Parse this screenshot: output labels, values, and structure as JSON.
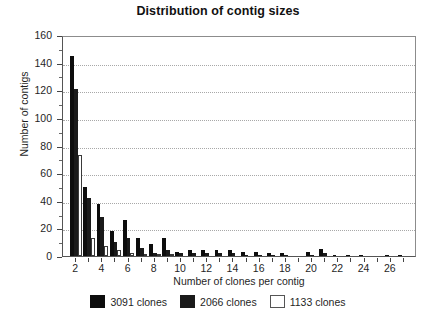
{
  "chart_data": {
    "type": "bar",
    "title": "Distribution of contig sizes",
    "xlabel": "Number of clones per contig",
    "ylabel": "Number of contigs",
    "xlim": [
      1,
      28
    ],
    "ylim": [
      0,
      160
    ],
    "ytick_step": 20,
    "ytick_minor_step": 10,
    "xtick_step": 2,
    "grid": "horizontal-dotted",
    "legend_position": "bottom-center",
    "categories": [
      2,
      3,
      4,
      5,
      6,
      7,
      8,
      9,
      10,
      11,
      12,
      13,
      14,
      15,
      16,
      17,
      18,
      19,
      20,
      21,
      22,
      23,
      24,
      25,
      26,
      27
    ],
    "ytick_labels": [
      "0",
      "20",
      "40",
      "60",
      "80",
      "100",
      "120",
      "140",
      "160"
    ],
    "xtick_labels": [
      "2",
      "4",
      "6",
      "8",
      "10",
      "12",
      "14",
      "16",
      "18",
      "20",
      "22",
      "24",
      "26"
    ],
    "series": [
      {
        "name": "3091 clones",
        "color": "#0d0d0d",
        "values": [
          145,
          50,
          38,
          18,
          26,
          13,
          9,
          13,
          3,
          4,
          4,
          4,
          4,
          3,
          3,
          2,
          2,
          0,
          3,
          5,
          1,
          1,
          1,
          0,
          1,
          1
        ]
      },
      {
        "name": "2066 clones",
        "color": "#1a1a1a",
        "values": [
          121,
          42,
          28,
          10,
          13,
          6,
          2,
          4,
          2,
          2,
          2,
          2,
          2,
          1,
          1,
          1,
          1,
          0,
          1,
          2,
          0,
          0,
          0,
          0,
          0,
          0
        ]
      },
      {
        "name": "1133 clones",
        "color": "#ffffff",
        "values": [
          73,
          13,
          7,
          4,
          2,
          1,
          1,
          1,
          0,
          0,
          0,
          0,
          0,
          0,
          0,
          0,
          0,
          0,
          0,
          0,
          0,
          0,
          0,
          0,
          0,
          0
        ]
      }
    ]
  }
}
